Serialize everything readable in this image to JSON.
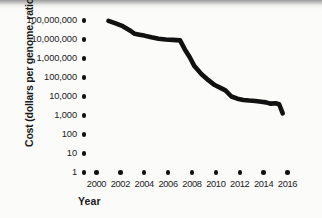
{
  "chart_data": {
    "type": "line",
    "title": "",
    "xlabel": "Year",
    "ylabel": "Cost (dollars per genome, ratio scale)",
    "yscale": "log",
    "ylim": [
      1,
      100000000
    ],
    "xlim": [
      2000,
      2016
    ],
    "grid": false,
    "legend": null,
    "y_tick_labels": [
      "100,000,000",
      "10,000,000",
      "1,000,000",
      "100,000",
      "10,000",
      "1,000",
      "100",
      "10",
      "1"
    ],
    "y_tick_values": [
      100000000,
      10000000,
      1000000,
      100000,
      10000,
      1000,
      100,
      10,
      1
    ],
    "x_tick_labels": [
      "2000",
      "2002",
      "2004",
      "2006",
      "2008",
      "2010",
      "2012",
      "2014",
      "2016"
    ],
    "x_tick_values": [
      2000,
      2002,
      2004,
      2006,
      2008,
      2010,
      2012,
      2014,
      2016
    ],
    "series": [
      {
        "name": "Cost per genome",
        "x": [
          2001.0,
          2001.6,
          2002.2,
          2002.8,
          2003.2,
          2003.6,
          2004.0,
          2004.6,
          2005.2,
          2005.8,
          2006.4,
          2007.0,
          2007.4,
          2007.8,
          2008.2,
          2008.8,
          2009.4,
          2009.9,
          2010.3,
          2010.8,
          2011.3,
          2011.8,
          2012.3,
          2012.8,
          2013.3,
          2013.8,
          2014.2,
          2014.6,
          2015.0,
          2015.3,
          2015.6
        ],
        "y": [
          95000000,
          70000000,
          50000000,
          30000000,
          20000000,
          18000000,
          16000000,
          13000000,
          11000000,
          10000000,
          9500000,
          9000000,
          3000000,
          1200000,
          400000,
          150000,
          70000,
          40000,
          30000,
          21000,
          10000,
          7700,
          6600,
          6100,
          5800,
          5300,
          4900,
          4200,
          4400,
          3900,
          1300
        ]
      }
    ],
    "annotations": []
  },
  "axis": {
    "y_title": "Cost (dollars per genome, ratio scale)",
    "x_title": "Year"
  }
}
